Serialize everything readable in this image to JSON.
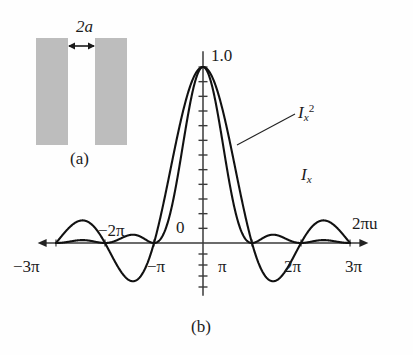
{
  "figure": {
    "panel_a_label": "(a)",
    "panel_b_label": "(b)",
    "aperture_label": "2a"
  },
  "chart_data": {
    "type": "line",
    "title": "",
    "xlabel": "2πu",
    "ylabel": "",
    "xlim": [
      -10.6,
      10.6
    ],
    "ylim": [
      -0.32,
      1.12
    ],
    "grid": false,
    "legend_position": "inline-annotations",
    "x_tick_labels": [
      "−3π",
      "−2π",
      "−1π",
      "0",
      "π",
      "2π",
      "3π"
    ],
    "x_tick_values": [
      -9.4248,
      -6.2832,
      -3.1416,
      0,
      3.1416,
      6.2832,
      9.4248
    ],
    "x_tick_display": [
      "−3π",
      "−2π",
      "−π",
      "0",
      "π",
      "2π",
      "3π"
    ],
    "y_tick_top_label": "1.0",
    "y_tick_zero_label": "0",
    "y_tick_values": [
      -0.25,
      -0.1875,
      -0.125,
      -0.0625,
      0,
      0.0833,
      0.1667,
      0.25,
      0.3333,
      0.4167,
      0.5,
      0.5833,
      0.6667,
      0.75,
      0.8333,
      0.9167,
      1.0
    ],
    "series": [
      {
        "name": "I_x",
        "name_parts": {
          "base": "I",
          "sub": "x",
          "sup": ""
        },
        "function": "sinc",
        "color": "#111111",
        "linewidth": 2.1,
        "annotation": {
          "text": "I_x",
          "x": 4.6,
          "y": 0.42
        },
        "key_points": {
          "peak": {
            "x": 0,
            "y": 1.0
          },
          "zeros": [
            -9.4248,
            -6.2832,
            -3.1416,
            3.1416,
            6.2832,
            9.4248
          ],
          "minima": [
            {
              "x": -4.4934,
              "y": -0.2172
            },
            {
              "x": 4.4934,
              "y": -0.2172
            }
          ],
          "side_maxima": [
            {
              "x": -7.7253,
              "y": 0.1284
            },
            {
              "x": 7.7253,
              "y": 0.1284
            }
          ]
        }
      },
      {
        "name": "I_x^2",
        "name_parts": {
          "base": "I",
          "sub": "x",
          "sup": "2"
        },
        "function": "sinc_squared",
        "color": "#111111",
        "linewidth": 2.1,
        "annotation": {
          "text": "I_x^2",
          "x": 3.15,
          "y": 0.74
        },
        "key_points": {
          "peak": {
            "x": 0,
            "y": 1.0
          },
          "zeros": [
            -9.4248,
            -6.2832,
            -3.1416,
            3.1416,
            6.2832,
            9.4248
          ],
          "side_maxima": [
            {
              "x": -4.4934,
              "y": 0.0472
            },
            {
              "x": 4.4934,
              "y": 0.0472
            },
            {
              "x": -7.7253,
              "y": 0.0165
            },
            {
              "x": 7.7253,
              "y": 0.0165
            }
          ]
        }
      }
    ],
    "axis_arrows": [
      "left",
      "right"
    ]
  },
  "aperture": {
    "left_block": {
      "x": 36,
      "y": 38,
      "w": 32,
      "h": 107
    },
    "right_block": {
      "x": 95,
      "y": 38,
      "w": 32,
      "h": 107
    },
    "fill": "#bdbdbd",
    "arrow_y": 46
  }
}
